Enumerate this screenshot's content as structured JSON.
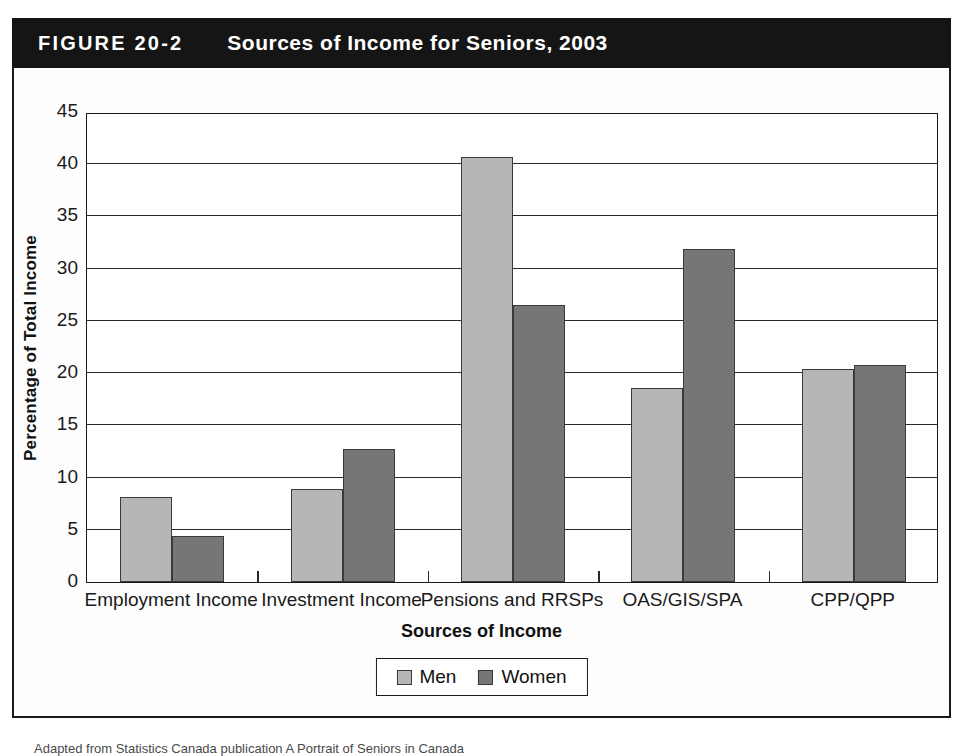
{
  "figure": {
    "number": "FIGURE 20-2",
    "title": "Sources of Income for Seniors, 2003",
    "source_note": "Adapted from Statistics Canada publication A Portrait of Seniors in Canada"
  },
  "legend": {
    "men_label": "Men",
    "women_label": "Women"
  },
  "colors": {
    "men": "#b6b6b6",
    "women": "#767676",
    "header_bar": "#151515",
    "axis": "#1a1a1a",
    "background": "#ffffff"
  },
  "chart_data": {
    "type": "bar",
    "title": "Sources of Income for Seniors, 2003",
    "xlabel": "Sources of Income",
    "ylabel": "Percentage of Total Income",
    "ylim": [
      0,
      45
    ],
    "ytick_step": 5,
    "yticks": [
      0,
      5,
      10,
      15,
      20,
      25,
      30,
      35,
      40,
      45
    ],
    "ytick_labels": [
      "0",
      "5",
      "10",
      "15",
      "20",
      "25",
      "30",
      "35",
      "40",
      "45"
    ],
    "grid": true,
    "legend_position": "bottom-center",
    "categories": [
      "Employment Income",
      "Investment Income",
      "Pensions and RRSPs",
      "OAS/GIS/SPA",
      "CPP/QPP"
    ],
    "series": [
      {
        "name": "Men",
        "values": [
          8.1,
          8.9,
          40.7,
          18.6,
          20.4
        ]
      },
      {
        "name": "Women",
        "values": [
          4.4,
          12.7,
          26.5,
          31.9,
          20.8
        ]
      }
    ]
  }
}
